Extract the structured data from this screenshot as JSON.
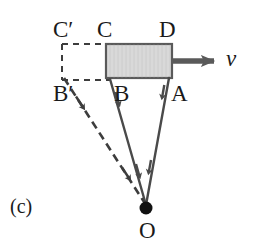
{
  "figure": {
    "panel_label": "(c)",
    "caption_type": "physics-vector-diagram",
    "colors": {
      "line": "#4a4a4a",
      "dashed": "#3d3d3d",
      "block_fill": "#d9d9d9",
      "block_stroke": "#5a5a5a",
      "velocity_arrow": "#5a5a5a",
      "pivot": "#111111",
      "text": "#1a1a1a",
      "background": "#ffffff"
    },
    "labels": {
      "c_prime": "C′",
      "c": "C",
      "d": "D",
      "b_prime": "B′",
      "b": "B",
      "a": "A",
      "o": "O",
      "velocity": "v"
    },
    "geometry": {
      "pivot": {
        "x": 146,
        "y": 208,
        "radius": 6.5
      },
      "block": {
        "x": 106,
        "y": 44,
        "width": 66,
        "height": 34
      },
      "dashed_block": {
        "x": 62,
        "y": 44,
        "width": 46,
        "height": 36
      },
      "points": {
        "C_prime": {
          "x": 62,
          "y": 44
        },
        "C": {
          "x": 108,
          "y": 44
        },
        "D": {
          "x": 172,
          "y": 44
        },
        "B_prime": {
          "x": 62,
          "y": 80
        },
        "B": {
          "x": 110,
          "y": 79
        },
        "A": {
          "x": 169,
          "y": 78
        }
      },
      "velocity_arrow": {
        "x1": 172,
        "y1": 61,
        "x2": 218,
        "y2": 61
      }
    },
    "rays": [
      {
        "name": "ray-OA",
        "from": "A",
        "to": "O",
        "style": "solid"
      },
      {
        "name": "ray-OB",
        "from": "B",
        "to": "O",
        "style": "solid"
      },
      {
        "name": "ray-OBprime",
        "from": "B′",
        "to": "O",
        "style": "dashed"
      }
    ]
  }
}
